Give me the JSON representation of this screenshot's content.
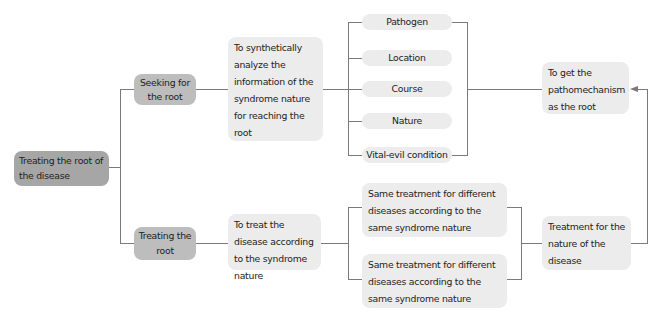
{
  "diagram": {
    "root": {
      "label": "Treating the root of the disease"
    },
    "branches": [
      {
        "label": "Seeking for the root",
        "detail": "To synthetically analyze the information of the syndrome nature for reaching the root",
        "factors": [
          "Pathogen",
          "Location",
          "Course",
          "Nature",
          "Vital-evil condition"
        ],
        "result": "To get the pathomechanism as the root"
      },
      {
        "label": "Treating the root",
        "detail": "To treat the disease according to the syndrome nature",
        "options": [
          "Same treatment for different diseases according to the same syndrome nature",
          "Same treatment for different diseases according to the same syndrome nature"
        ],
        "result": "Treatment for the nature of the disease"
      }
    ],
    "colors": {
      "root_fill": "#a6a6a6",
      "level1_fill": "#bdbdbd",
      "node_fill": "#ececec",
      "connector": "#7a7a7a"
    }
  }
}
